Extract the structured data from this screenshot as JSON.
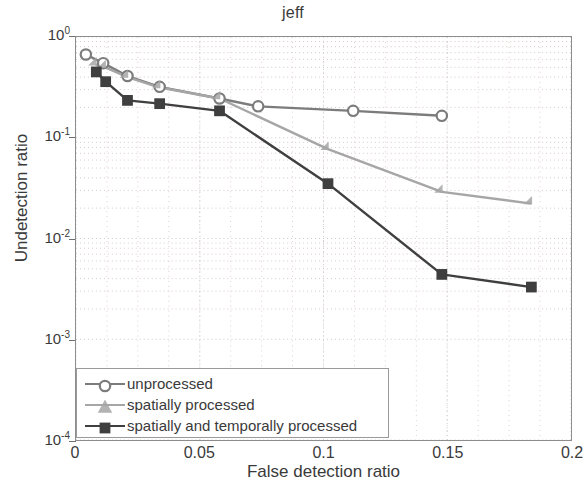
{
  "chart_data": {
    "type": "line",
    "title": "jeff",
    "xlabel": "False detection ratio",
    "ylabel": "Undetection ratio",
    "xscale": "linear",
    "yscale": "log",
    "xlim": [
      0,
      0.2
    ],
    "ylim": [
      0.0001,
      1
    ],
    "xticks": [
      "0",
      "0.05",
      "0.1",
      "0.15",
      "0.2"
    ],
    "xtick_values": [
      0,
      0.05,
      0.1,
      0.15,
      0.2
    ],
    "yticks": [
      "10^0",
      "10^-1",
      "10^-2",
      "10^-3",
      "10^-4"
    ],
    "ytick_values": [
      1,
      0.1,
      0.01,
      0.001,
      0.0001
    ],
    "grid": true,
    "legend_position": "lower left",
    "series": [
      {
        "name": "unprocessed",
        "marker": "circle",
        "color": "#7c7c7c",
        "points": [
          [
            0.004,
            0.67
          ],
          [
            0.011,
            0.55
          ],
          [
            0.0208,
            0.41
          ],
          [
            0.0338,
            0.32
          ],
          [
            0.058,
            0.245
          ],
          [
            0.0736,
            0.205
          ],
          [
            0.112,
            0.185
          ],
          [
            0.1478,
            0.165
          ]
        ]
      },
      {
        "name": "spatially processed",
        "marker": "triangle",
        "color": "#a6a6a6",
        "points": [
          [
            0.008,
            0.53
          ],
          [
            0.0118,
            0.5
          ],
          [
            0.0208,
            0.4
          ],
          [
            0.0338,
            0.315
          ],
          [
            0.058,
            0.245
          ],
          [
            0.1018,
            0.077
          ],
          [
            0.1478,
            0.029
          ],
          [
            0.184,
            0.0222
          ]
        ]
      },
      {
        "name": "spatially and temporally processed",
        "marker": "square",
        "color": "#3f3f3f",
        "points": [
          [
            0.0082,
            0.45
          ],
          [
            0.012,
            0.36
          ],
          [
            0.0208,
            0.235
          ],
          [
            0.0338,
            0.218
          ],
          [
            0.058,
            0.185
          ],
          [
            0.1018,
            0.035
          ],
          [
            0.1478,
            0.0044
          ],
          [
            0.184,
            0.0033
          ]
        ]
      }
    ]
  }
}
